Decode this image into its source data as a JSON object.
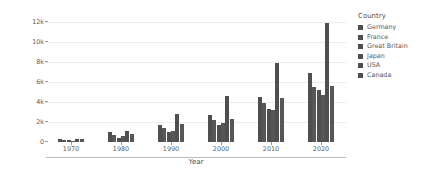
{
  "chart_data": {
    "type": "bar",
    "title": "",
    "xlabel": "Year",
    "ylabel": "Spending_USD",
    "grid": true,
    "legend_position": "right",
    "legend_title": "Country",
    "categories": [
      1970,
      1980,
      1990,
      2000,
      2010,
      2020
    ],
    "xtick_labels": [
      "1970",
      "1980",
      "1990",
      "2000",
      "2010",
      "2020"
    ],
    "ytick_labels": [
      "0",
      "2k",
      "4k",
      "6k",
      "8k",
      "10k",
      "12k"
    ],
    "ytick_values": [
      0,
      2000,
      4000,
      6000,
      8000,
      10000,
      12000
    ],
    "ylim": [
      0,
      12600
    ],
    "xlim": [
      1965,
      2025
    ],
    "bar_color": "#4f4f4f",
    "series": [
      {
        "name": "Germany",
        "values": [
          270,
          980,
          1750,
          2700,
          4500,
          6900
        ]
      },
      {
        "name": "France",
        "values": [
          190,
          670,
          1450,
          2200,
          3900,
          5500
        ]
      },
      {
        "name": "Great Britain",
        "values": [
          160,
          450,
          960,
          1750,
          3300,
          5200
        ]
      },
      {
        "name": "Japan",
        "values": [
          140,
          570,
          1110,
          1900,
          3200,
          4700
        ]
      },
      {
        "name": "USA",
        "values": [
          350,
          1100,
          2850,
          4600,
          7900,
          11900
        ]
      },
      {
        "name": "Canada",
        "values": [
          300,
          830,
          1760,
          2300,
          4400,
          5600
        ]
      }
    ]
  }
}
